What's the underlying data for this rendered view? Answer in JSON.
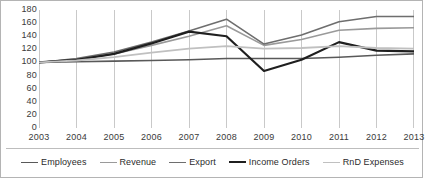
{
  "chart_data": {
    "type": "line",
    "title": "",
    "xlabel": "",
    "ylabel": "",
    "x": [
      2003,
      2004,
      2005,
      2006,
      2007,
      2008,
      2009,
      2010,
      2011,
      2012,
      2013
    ],
    "categories": [
      "2003",
      "2004",
      "2005",
      "2006",
      "2007",
      "2008",
      "2009",
      "2010",
      "2011",
      "2012",
      "2013"
    ],
    "ylim": [
      0,
      180
    ],
    "ytick_values": [
      0,
      20,
      40,
      60,
      80,
      100,
      120,
      140,
      160,
      180
    ],
    "ytick_labels": [
      "0",
      "20",
      "40",
      "60",
      "80",
      "100",
      "120",
      "140",
      "160",
      "180"
    ],
    "grid": "vertical",
    "legend_position": "bottom",
    "series": [
      {
        "name": "Employees",
        "color": "#595959",
        "width": 1.6,
        "values": [
          100,
          101,
          102,
          103,
          104,
          106,
          106,
          106,
          108,
          111,
          113
        ]
      },
      {
        "name": "Revenue",
        "color": "#9a9a9a",
        "width": 1.6,
        "values": [
          100,
          105,
          113,
          126,
          140,
          156,
          126,
          135,
          149,
          152,
          153
        ]
      },
      {
        "name": "Export",
        "color": "#6e6e6e",
        "width": 1.6,
        "values": [
          100,
          106,
          116,
          131,
          148,
          166,
          128,
          142,
          162,
          170,
          170
        ]
      },
      {
        "name": "Income Orders",
        "color": "#1f1f1f",
        "width": 2.2,
        "values": [
          100,
          104,
          113,
          129,
          147,
          140,
          87,
          104,
          131,
          118,
          117
        ]
      },
      {
        "name": "RnD Expenses",
        "color": "#c0c0c0",
        "width": 1.8,
        "values": [
          100,
          103,
          108,
          115,
          121,
          125,
          121,
          122,
          125,
          122,
          121
        ]
      }
    ]
  },
  "legend": {
    "items": [
      {
        "label": "Employees"
      },
      {
        "label": "Revenue"
      },
      {
        "label": "Export"
      },
      {
        "label": "Income Orders"
      },
      {
        "label": "RnD Expenses"
      }
    ]
  }
}
